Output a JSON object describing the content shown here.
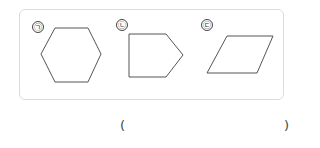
{
  "problem": {
    "figures": [
      {
        "label": "㉠",
        "shape": "hexagon",
        "points": "41,54 55,28 88,28 101,54 88,82 55,82"
      },
      {
        "label": "㉡",
        "shape": "pentagon",
        "points": "129,34 166,34 183,55 166,77 129,77"
      },
      {
        "label": "㉢",
        "shape": "parallelogram",
        "points": "207,73 227,36 273,36 257,73"
      }
    ],
    "answer": {
      "open_paren": "(",
      "value": "",
      "close_paren": ")"
    }
  },
  "colors": {
    "box_border": "#dcdcdc",
    "stroke": "#555555"
  }
}
